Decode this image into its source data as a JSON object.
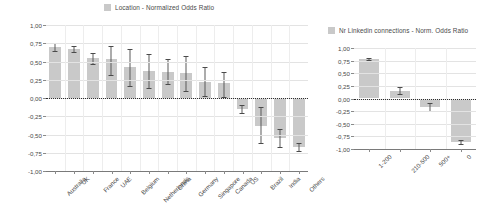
{
  "left_chart": {
    "legend_label": "Location - Normalized Odds Ratio",
    "swatch_color": "#c9c9c9"
  },
  "right_chart": {
    "legend_label": "Nr Linkedin connections - Norm. Odds Ratio",
    "swatch_color": "#c9c9c9"
  },
  "chart_data": [
    {
      "type": "bar",
      "title": "Location - Normalized Odds Ratio",
      "xlabel": "",
      "ylabel": "",
      "ylim": [
        -1.0,
        1.0
      ],
      "ytick_labels": [
        "1,00",
        "0,75",
        "0,50",
        "0,25",
        "0,00",
        "-0,25",
        "-0,50",
        "-0,75",
        "-1,00"
      ],
      "ytick_values": [
        1.0,
        0.75,
        0.5,
        0.25,
        0.0,
        -0.25,
        -0.5,
        -0.75,
        -1.0
      ],
      "grid": true,
      "legend_position": "top-center",
      "categories": [
        "Australia",
        "UK",
        "France",
        "UAE",
        "Belgium",
        "Netherlands",
        "China",
        "Germany",
        "Singapore",
        "Canada",
        "US",
        "Brazil",
        "India",
        "Others"
      ],
      "values": [
        0.7,
        0.67,
        0.55,
        0.54,
        0.43,
        0.37,
        0.36,
        0.34,
        0.22,
        0.2,
        -0.15,
        -0.38,
        -0.55,
        -0.67
      ],
      "error_low": [
        0.64,
        0.63,
        0.46,
        0.32,
        0.17,
        0.14,
        0.19,
        0.09,
        0.03,
        0.02,
        -0.2,
        -0.62,
        -0.67,
        -0.72
      ],
      "error_high": [
        0.76,
        0.71,
        0.62,
        0.71,
        0.67,
        0.6,
        0.53,
        0.57,
        0.43,
        0.36,
        -0.1,
        -0.13,
        -0.43,
        -0.62
      ]
    },
    {
      "type": "bar",
      "title": "Nr Linkedin connections - Norm. Odds Ratio",
      "xlabel": "",
      "ylabel": "",
      "ylim": [
        -1.0,
        1.0
      ],
      "ytick_labels": [
        "1,00",
        "0,75",
        "0,50",
        "0,25",
        "0,00",
        "-0,25",
        "-0,50",
        "-0,75",
        "-1,00"
      ],
      "ytick_values": [
        1.0,
        0.75,
        0.5,
        0.25,
        0.0,
        -0.25,
        -0.5,
        -0.75,
        -1.0
      ],
      "grid": true,
      "legend_position": "top-center",
      "categories": [
        "1-200",
        "210-500",
        "500+",
        "0"
      ],
      "values": [
        0.78,
        0.15,
        -0.16,
        -0.87
      ],
      "error_low": [
        0.76,
        0.09,
        -0.24,
        -0.91
      ],
      "error_high": [
        0.8,
        0.23,
        -0.09,
        -0.83
      ]
    }
  ]
}
